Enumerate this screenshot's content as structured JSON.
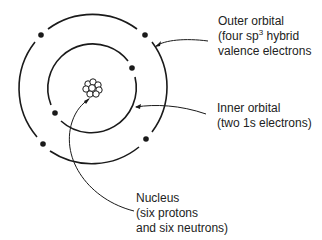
{
  "diagram": {
    "labels": {
      "outer": {
        "line1": "Outer orbital",
        "line2_pre": "(four sp",
        "line2_sup": "3",
        "line2_post": " hybrid",
        "line3": "valence electrons"
      },
      "inner": {
        "line1": "Inner orbital",
        "line2": "(two 1s electrons)"
      },
      "nucleus": {
        "line1": "Nucleus",
        "line2": "(six protons",
        "line3": "and six neutrons)"
      }
    },
    "geometry": {
      "center": [
        92,
        88
      ],
      "outer_radius": 75,
      "inner_radius": 45,
      "outer_electrons": 4,
      "inner_electrons": 2
    },
    "colors": {
      "ink": "#1a1a1a",
      "background": "#ffffff"
    }
  }
}
